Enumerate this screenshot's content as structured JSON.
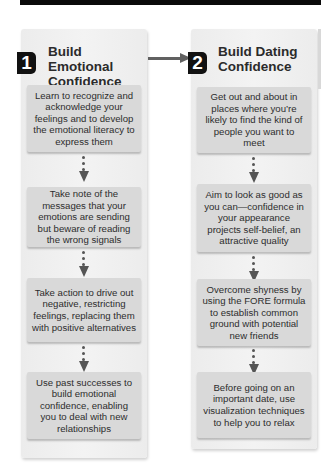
{
  "diagram": {
    "type": "flow",
    "colors": {
      "badge_bg": "#111111",
      "badge_text": "#ffffff",
      "column_bg": "#efefef",
      "card_bg": "#d9d9d9",
      "arrow": "#555555",
      "title_text": "#2b2b2b",
      "body_text": "#2d2d2d"
    },
    "steps": [
      {
        "number": "1",
        "title": "Build Emotional Confidence",
        "items": [
          "Learn to recognize and acknowledge your feelings and to develop the emotional literacy to express them",
          "Take note of the messages that your emotions are sending but beware of reading the wrong signals",
          "Take action to drive out negative, restricting feelings, replacing them with positive alternatives",
          "Use past successes to build emotional confidence, enabling you to deal with new relationships"
        ]
      },
      {
        "number": "2",
        "title": "Build Dating Confidence",
        "items": [
          "Get out and about in places where you’re likely to find the kind of people you want to meet",
          "Aim to look as good as you can—confidence in your appearance projects self-belief, an attractive quality",
          "Overcome shyness by using the FORE formula to establish common ground with potential new friends",
          "Before going on an important date, use visualization techniques to help you to relax"
        ]
      }
    ],
    "edges": [
      {
        "from": "step-1",
        "to": "step-2",
        "style": "solid-arrow"
      }
    ]
  }
}
